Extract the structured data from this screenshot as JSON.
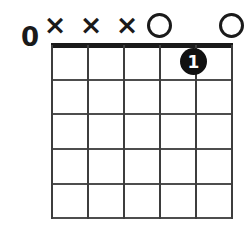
{
  "diagram": {
    "kind": "guitar-chord-diagram",
    "open_marker_label": "O",
    "muted_marker_label": "×",
    "left_open_label": "0",
    "ink_color": "#1a1a1a",
    "grid_color": "#4d4d4d",
    "background_color": "#ffffff",
    "frets": 5,
    "strings": 6,
    "string_markers": [
      {
        "string": 1,
        "type": "muted",
        "label": "×"
      },
      {
        "string": 2,
        "type": "muted",
        "label": "×"
      },
      {
        "string": 3,
        "type": "muted",
        "label": "×"
      },
      {
        "string": 4,
        "type": "open",
        "label": "O"
      },
      {
        "string": 5,
        "type": "none",
        "label": ""
      },
      {
        "string": 6,
        "type": "open",
        "label": "O"
      }
    ],
    "finger_dots": [
      {
        "string": 5,
        "fret": 1,
        "finger": "1"
      }
    ]
  }
}
